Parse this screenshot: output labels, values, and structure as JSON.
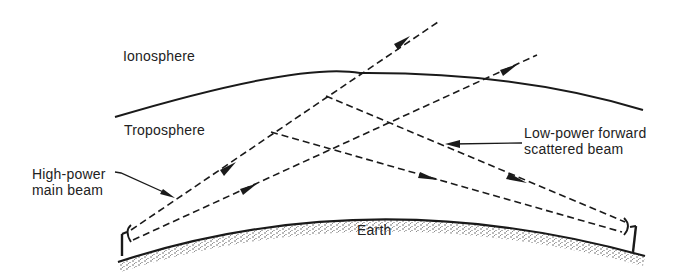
{
  "diagram": {
    "type": "tropospheric scatter propagation",
    "labels": {
      "ionosphere": "Ionosphere",
      "troposphere": "Troposphere",
      "earth": "Earth",
      "main_beam_line1": "High-power",
      "main_beam_line2": "main beam",
      "scatter_beam_line1": "Low-power forward",
      "scatter_beam_line2": "scattered beam"
    },
    "elements": [
      {
        "id": "troposphere-boundary",
        "kind": "curve"
      },
      {
        "id": "earth-surface",
        "kind": "curve-stippled"
      },
      {
        "id": "transmit-antenna",
        "kind": "dish",
        "side": "left"
      },
      {
        "id": "receive-antenna",
        "kind": "dish",
        "side": "right"
      },
      {
        "id": "main-beam-upper",
        "kind": "dashed-arrow"
      },
      {
        "id": "main-beam-lower",
        "kind": "dashed-arrow"
      },
      {
        "id": "scatter-beam-upper",
        "kind": "dashed-arrow"
      },
      {
        "id": "scatter-beam-lower",
        "kind": "dashed-arrow"
      }
    ],
    "colors": {
      "ink": "#1a1a1a",
      "background": "#ffffff"
    }
  }
}
